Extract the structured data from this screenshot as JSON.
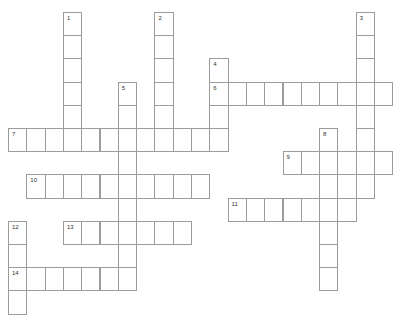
{
  "puzzle": {
    "cell_width": 18.3,
    "cell_height": 23.2,
    "origin_x": 8,
    "origin_y": 12,
    "border_color": "#9c9c9c",
    "words": [
      {
        "number": "1",
        "direction": "down",
        "col": 3,
        "row": 0,
        "length": 6
      },
      {
        "number": "2",
        "direction": "down",
        "col": 8,
        "row": 0,
        "length": 6
      },
      {
        "number": "3",
        "direction": "down",
        "col": 19,
        "row": 0,
        "length": 8
      },
      {
        "number": "4",
        "direction": "down",
        "col": 11,
        "row": 2,
        "length": 4
      },
      {
        "number": "5",
        "direction": "down",
        "col": 6,
        "row": 3,
        "length": 9
      },
      {
        "number": "6",
        "direction": "across",
        "col": 11,
        "row": 3,
        "length": 10
      },
      {
        "number": "7",
        "direction": "across",
        "col": 0,
        "row": 5,
        "length": 12
      },
      {
        "number": "8",
        "direction": "down",
        "col": 17,
        "row": 5,
        "length": 7
      },
      {
        "number": "9",
        "direction": "across",
        "col": 15,
        "row": 6,
        "length": 6
      },
      {
        "number": "10",
        "direction": "across",
        "col": 1,
        "row": 7,
        "length": 10
      },
      {
        "number": "11",
        "direction": "across",
        "col": 12,
        "row": 8,
        "length": 7
      },
      {
        "number": "12",
        "direction": "down",
        "col": 0,
        "row": 9,
        "length": 4
      },
      {
        "number": "13",
        "direction": "across",
        "col": 3,
        "row": 9,
        "length": 7
      },
      {
        "number": "14",
        "direction": "across",
        "col": 0,
        "row": 11,
        "length": 7
      }
    ],
    "extra_cells": [
      {
        "col": 18,
        "row": 7
      }
    ]
  }
}
